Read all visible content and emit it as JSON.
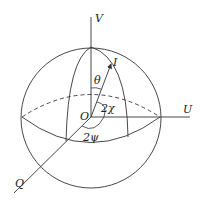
{
  "diagram": {
    "labels": {
      "v_axis": "V",
      "u_axis": "U",
      "q_axis": "Q",
      "origin": "O",
      "vector": "I",
      "theta": "θ",
      "two_chi": "2χ",
      "two_psi": "2ψ"
    },
    "colors": {
      "stroke": "#333333",
      "background": "#ffffff"
    }
  }
}
